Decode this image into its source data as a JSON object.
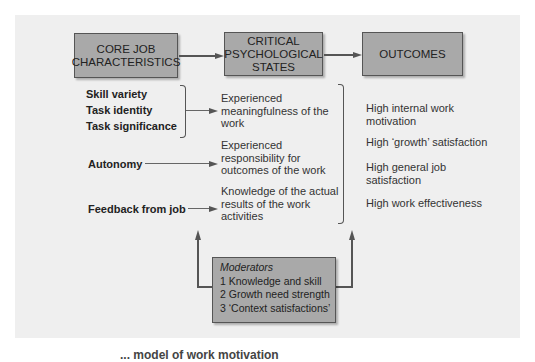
{
  "diagram": {
    "headers": {
      "core": "CORE JOB\nCHARACTERISTICS",
      "critical": "CRITICAL\nPSYCHOLOGICAL\nSTATES",
      "outcomes": "OUTCOMES"
    },
    "characteristics": [
      "Skill variety",
      "Task identity",
      "Task significance",
      "Autonomy",
      "Feedback from job"
    ],
    "states": [
      "Experienced\nmeaningfulness of the\nwork",
      "Experienced\nresponsibility for\noutcomes of the work",
      "Knowledge of the actual\nresults of the work\nactivities"
    ],
    "outcomes": [
      "High internal work\nmotivation",
      "High ‘growth’ satisfaction",
      "High general job\nsatisfaction",
      "High work effectiveness"
    ],
    "moderators": {
      "title": "Moderators",
      "items": [
        "1 Knowledge and skill",
        "2 Growth need strength",
        "3 ‘Context satisfactions’"
      ]
    },
    "caption": "... model of work motivation"
  },
  "colors": {
    "panel": "#efefef",
    "box_fill": "#a9a9a9",
    "arrow": "#555555"
  }
}
